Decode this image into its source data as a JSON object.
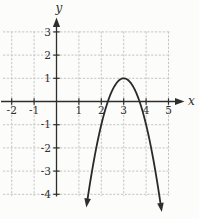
{
  "figure": {
    "background": "#fcfcfa",
    "axis_color": "#2e2e2e",
    "grid_color": "#c4c4c4",
    "curve_color": "#2a2a2a",
    "x_axis_label": "x",
    "y_axis_label": "y"
  },
  "chart_data": {
    "type": "line",
    "title": "",
    "xlabel": "x",
    "ylabel": "y",
    "xlim": [
      -2.5,
      5.7
    ],
    "ylim": [
      -4.8,
      3.6
    ],
    "x_ticks": [
      -2,
      -1,
      1,
      2,
      3,
      4,
      5
    ],
    "y_ticks": [
      -4,
      -3,
      -2,
      -1,
      1,
      2,
      3
    ],
    "grid": true,
    "legend": false,
    "series": [
      {
        "name": "downward-parabola",
        "equation": "y = -2(x - 3)^2 + 1",
        "form": {
          "a": -2,
          "h": 3,
          "k": 1
        },
        "vertex": [
          3,
          1
        ],
        "x_intercepts": [
          2.29,
          3.71
        ],
        "x_range_drawn": [
          1.39,
          4.64
        ],
        "arrow_ends": true,
        "points": [
          [
            1.5,
            -3.5
          ],
          [
            2,
            -1
          ],
          [
            2.29,
            0
          ],
          [
            2.5,
            0.5
          ],
          [
            3,
            1
          ],
          [
            3.5,
            0.5
          ],
          [
            3.71,
            0
          ],
          [
            4,
            -1
          ],
          [
            4.5,
            -3.5
          ]
        ]
      }
    ]
  }
}
